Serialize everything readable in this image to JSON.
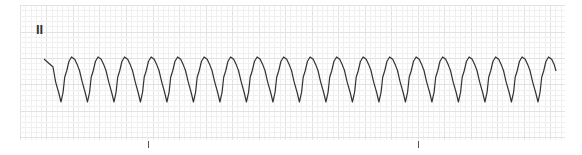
{
  "ecg_strip": {
    "lead_label": "II",
    "colors": {
      "trace": "#333333",
      "grid_minor": "#f0f0f0",
      "grid_major": "#e2e2e2",
      "background": "#ffffff",
      "tick": "#555555"
    },
    "grid": {
      "left": 20,
      "top": 5,
      "right": 565,
      "bottom": 140,
      "minor": 5.3,
      "major": 26.5
    },
    "waveform": {
      "start_x": 44,
      "end_x": 556,
      "period_px": 26.5,
      "peak_y": 57,
      "trough_y": 102,
      "beat_count": 19
    },
    "time_markers_x": [
      148,
      418
    ]
  }
}
